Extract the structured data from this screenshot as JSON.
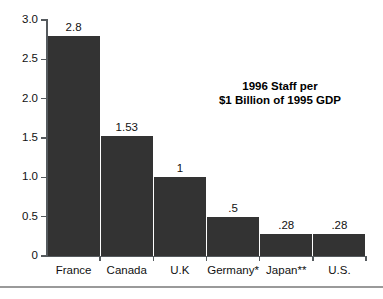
{
  "chart_data": {
    "type": "bar",
    "title": "1996 Staff per $1 Billion of 1995 GDP",
    "title_lines": [
      "1996 Staff per",
      "$1 Billion of 1995 GDP"
    ],
    "categories": [
      "France",
      "Canada",
      "U.K",
      "Germany*",
      "Japan**",
      "U.S."
    ],
    "values": [
      2.8,
      1.53,
      1,
      0.5,
      0.28,
      0.28
    ],
    "value_labels": [
      "2.8",
      "1.53",
      "1",
      ".5",
      ".28",
      ".28"
    ],
    "xlabel": "",
    "ylabel": "",
    "ylim": [
      0,
      3.0
    ],
    "yticks": [
      0,
      0.5,
      1.0,
      1.5,
      2.0,
      2.5,
      3.0
    ],
    "ytick_labels": [
      "0",
      "0.5",
      "1.0",
      "1.5",
      "2.0",
      "2.5",
      "3.0"
    ],
    "grid": false,
    "legend": false,
    "bar_color": "#333333",
    "axis_color": "#555a5e",
    "background": "#ffffff"
  }
}
